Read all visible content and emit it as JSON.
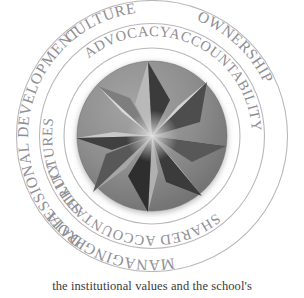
{
  "figure": {
    "kind": "concentric-ring-wheel-diagram",
    "background_color": "#ffffff",
    "ring_stroke_color": "#b8b8bc",
    "ring_text_color": "#8e8e93"
  },
  "outer_ring": {
    "name": "outer-ring",
    "labels": [
      {
        "text": "CULTURE",
        "position": "top",
        "start_angle_deg": -66,
        "end_angle_deg": -20
      },
      {
        "text": "OWNERSHIP",
        "position": "right",
        "start_angle_deg": -6,
        "end_angle_deg": 62
      },
      {
        "text": "MANAGING DATA",
        "position": "bottom",
        "start_angle_deg": 76,
        "end_angle_deg": 160
      },
      {
        "text": "PROFESSIONAL DEVELOPMENT",
        "position": "left",
        "start_angle_deg": 176,
        "end_angle_deg": 292
      }
    ]
  },
  "inner_ring": {
    "name": "inner-ring",
    "labels": [
      {
        "text": "ADVOCACY",
        "position": "top",
        "start_angle_deg": -52,
        "end_angle_deg": -6
      },
      {
        "text": "ACCOUNTABILITY",
        "position": "right",
        "start_angle_deg": 8,
        "end_angle_deg": 76
      },
      {
        "text": "SHARED ACCOUNTABILITY",
        "position": "bottom",
        "start_angle_deg": 96,
        "end_angle_deg": 172
      },
      {
        "text": "STRUCTURES",
        "position": "left",
        "start_angle_deg": 186,
        "end_angle_deg": 250
      }
    ]
  },
  "center_medallion": {
    "name": "pinwheel-star",
    "description": "eight-pointed folded-paper pinwheel star on a circular disc",
    "disc_color": "#8d8d8d",
    "disc_shadow_color": "#6f6f6f",
    "facet_light_color": "#d6d6d6",
    "facet_mid_color": "#a9a9a9",
    "facet_dark_color": "#4a4a4a",
    "facet_darkest_color": "#2f2f2f",
    "point_count": 8
  },
  "caption": {
    "text": "the institutional values and the school's"
  }
}
